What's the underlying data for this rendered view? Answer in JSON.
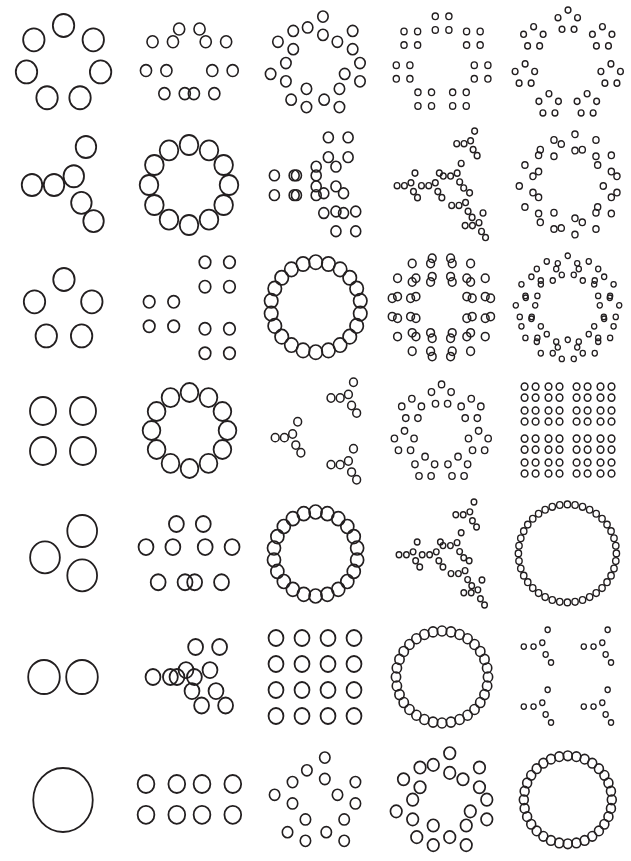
{
  "figure": {
    "name": "hierarchical-dot-pattern-grid",
    "background_color": "#ffffff",
    "stroke_color": "#231f20",
    "width": 631,
    "height": 861,
    "rows": 7,
    "columns": 5
  },
  "shapes": {
    "ring7": {
      "label": "ring-of-7",
      "count": 7,
      "type": "ring",
      "points": [
        [
          0.0,
          -1.0
        ],
        [
          0.782,
          -0.623
        ],
        [
          0.975,
          0.223
        ],
        [
          0.434,
          0.901
        ],
        [
          -0.434,
          0.901
        ],
        [
          -0.975,
          0.223
        ],
        [
          -0.782,
          -0.623
        ]
      ]
    },
    "ring6y": {
      "label": "y-arrow-6",
      "count": 6,
      "type": "custom",
      "points": [
        [
          -1.0,
          0.05
        ],
        [
          -0.42,
          0.05
        ],
        [
          0.1,
          -0.18
        ],
        [
          0.42,
          -0.95
        ],
        [
          0.3,
          0.52
        ],
        [
          0.62,
          1.0
        ]
      ]
    },
    "ring5": {
      "label": "ring-of-5",
      "count": 5,
      "type": "ring",
      "points": [
        [
          -0.05,
          -1.0
        ],
        [
          0.85,
          -0.28
        ],
        [
          0.52,
          0.82
        ],
        [
          -0.62,
          0.82
        ],
        [
          -1.0,
          -0.28
        ]
      ]
    },
    "square4": {
      "label": "square-of-4",
      "count": 4,
      "type": "square",
      "points": [
        [
          -1.0,
          -1.0
        ],
        [
          1.0,
          -1.0
        ],
        [
          -1.0,
          1.0
        ],
        [
          1.0,
          1.0
        ]
      ]
    },
    "tri3": {
      "label": "triangle-of-3",
      "count": 3,
      "type": "triangle",
      "points": [
        [
          0.55,
          -1.0
        ],
        [
          -1.0,
          0.1
        ],
        [
          0.55,
          0.85
        ]
      ]
    },
    "pair2": {
      "label": "pair-of-2",
      "count": 2,
      "type": "pair",
      "points": [
        [
          -1.0,
          0.0
        ],
        [
          1.0,
          0.0
        ]
      ]
    },
    "single1": {
      "label": "single",
      "count": 1,
      "type": "single",
      "points": [
        [
          0.0,
          0.0
        ]
      ]
    },
    "ring12": {
      "label": "ring-of-12",
      "count": 12,
      "type": "ring"
    },
    "ring22": {
      "label": "ring-of-22",
      "count": 22,
      "type": "ring"
    },
    "ring32": {
      "label": "ring-of-32",
      "count": 32,
      "type": "ring"
    },
    "ring40": {
      "label": "ring-of-40",
      "count": 40,
      "type": "ring"
    }
  },
  "cells": [
    {
      "row": 1,
      "col": 1,
      "name": "cell-r1c1",
      "levels": [
        "ring7"
      ],
      "radius": 11.5,
      "scale": 38,
      "stroke": 1.8
    },
    {
      "row": 1,
      "col": 2,
      "name": "cell-r1c2",
      "levels": [
        "ring7",
        "pair2"
      ],
      "radius": 6.0,
      "scale": 34,
      "sub": 0.3,
      "stroke": 1.6
    },
    {
      "row": 1,
      "col": 3,
      "name": "cell-r1c3",
      "levels": [
        "ring7",
        "tri3"
      ],
      "radius": 5.6,
      "scale": 38,
      "sub": 0.26,
      "stroke": 1.6
    },
    {
      "row": 1,
      "col": 4,
      "name": "cell-r1c4",
      "levels": [
        "ring7",
        "square4"
      ],
      "radius": 3.3,
      "scale": 40,
      "sub": 0.17,
      "stroke": 1.4
    },
    {
      "row": 1,
      "col": 5,
      "name": "cell-r1c5",
      "levels": [
        "ring7",
        "ring5"
      ],
      "radius": 3.1,
      "scale": 44,
      "sub": 0.24,
      "stroke": 1.4
    },
    {
      "row": 2,
      "col": 1,
      "name": "cell-r2c1",
      "levels": [
        "ring6y"
      ],
      "radius": 11.0,
      "scale": 38,
      "stroke": 1.8
    },
    {
      "row": 2,
      "col": 2,
      "name": "cell-r2c2",
      "levels": [
        "ring12"
      ],
      "radius": 10.0,
      "scale": 40,
      "stroke": 1.8
    },
    {
      "row": 2,
      "col": 3,
      "name": "cell-r2c3",
      "levels": [
        "ring6y",
        "square4"
      ],
      "radius": 5.4,
      "scale": 38,
      "sub": 0.26,
      "stroke": 1.6
    },
    {
      "row": 2,
      "col": 4,
      "name": "cell-r2c4",
      "levels": [
        "ring6y",
        "ring6y"
      ],
      "radius": 3.1,
      "scale": 42,
      "sub": 0.3,
      "stroke": 1.4
    },
    {
      "row": 2,
      "col": 5,
      "name": "cell-r2c5",
      "levels": [
        "ring12",
        "tri3"
      ],
      "radius": 3.3,
      "scale": 42,
      "sub": 0.21,
      "stroke": 1.4
    },
    {
      "row": 3,
      "col": 1,
      "name": "cell-r3c1",
      "levels": [
        "ring5"
      ],
      "radius": 11.5,
      "scale": 31,
      "stroke": 1.8
    },
    {
      "row": 3,
      "col": 2,
      "name": "cell-r3c2",
      "levels": [
        "tri3",
        "square4"
      ],
      "radius": 6.2,
      "scale": 36,
      "sub": 0.34,
      "stroke": 1.7
    },
    {
      "row": 3,
      "col": 3,
      "name": "cell-r3c3",
      "levels": [
        "ring22"
      ],
      "radius": 7.2,
      "scale": 45,
      "stroke": 1.7
    },
    {
      "row": 3,
      "col": 4,
      "name": "cell-r3c4",
      "levels": [
        "ring12",
        "square4"
      ],
      "radius": 4.2,
      "scale": 40,
      "sub": 0.23,
      "stroke": 1.5
    },
    {
      "row": 3,
      "col": 5,
      "name": "cell-r3c5",
      "levels": [
        "ring12",
        "ring5"
      ],
      "radius": 2.8,
      "scale": 42,
      "sub": 0.25,
      "stroke": 1.3
    },
    {
      "row": 4,
      "col": 1,
      "name": "cell-r4c1",
      "levels": [
        "square4"
      ],
      "radius": 14.0,
      "scale": 20,
      "stroke": 1.8
    },
    {
      "row": 4,
      "col": 2,
      "name": "cell-r4c2",
      "levels": [
        "ring12"
      ],
      "radius": 9.5,
      "scale": 38,
      "stroke": 1.8
    },
    {
      "row": 4,
      "col": 3,
      "name": "cell-r4c3",
      "levels": [
        "tri3",
        "ring6y"
      ],
      "radius": 4.2,
      "scale": 36,
      "sub": 0.44,
      "stroke": 1.5
    },
    {
      "row": 4,
      "col": 4,
      "name": "cell-r4c4",
      "levels": [
        "ring7",
        "ring5"
      ],
      "radius": 3.4,
      "scale": 38,
      "sub": 0.28,
      "stroke": 1.4
    },
    {
      "row": 4,
      "col": 5,
      "name": "cell-r4c5",
      "levels": [
        "square4",
        "square4",
        "square4"
      ],
      "radius": 3.6,
      "scale": 26,
      "sub": 0.46,
      "stroke": 1.5
    },
    {
      "row": 5,
      "col": 1,
      "name": "cell-r5c1",
      "levels": [
        "tri3"
      ],
      "radius": 16.0,
      "scale": 24,
      "stroke": 1.8
    },
    {
      "row": 5,
      "col": 2,
      "name": "cell-r5c2",
      "levels": [
        "ring5",
        "pair2"
      ],
      "radius": 8.0,
      "scale": 32,
      "sub": 0.42,
      "stroke": 1.8
    },
    {
      "row": 5,
      "col": 3,
      "name": "cell-r5c3",
      "levels": [
        "ring22"
      ],
      "radius": 7.0,
      "scale": 42,
      "stroke": 1.7
    },
    {
      "row": 5,
      "col": 4,
      "name": "cell-r5c4",
      "levels": [
        "ring6y",
        "ring6y"
      ],
      "radius": 3.0,
      "scale": 40,
      "sub": 0.32,
      "stroke": 1.4
    },
    {
      "row": 5,
      "col": 5,
      "name": "cell-r5c5",
      "levels": [
        "ring40"
      ],
      "radius": 3.4,
      "scale": 49,
      "stroke": 1.4
    },
    {
      "row": 6,
      "col": 1,
      "name": "cell-r6c1",
      "levels": [
        "pair2"
      ],
      "radius": 17.0,
      "scale": 19,
      "stroke": 1.8
    },
    {
      "row": 6,
      "col": 2,
      "name": "cell-r6c2",
      "levels": [
        "ring6y",
        "pair2"
      ],
      "radius": 8.0,
      "scale": 30,
      "sub": 0.4,
      "stroke": 1.8
    },
    {
      "row": 6,
      "col": 3,
      "name": "cell-r6c3",
      "levels": [
        "square4",
        "square4"
      ],
      "radius": 8.0,
      "scale": 26,
      "sub": 0.5,
      "stroke": 1.8
    },
    {
      "row": 6,
      "col": 4,
      "name": "cell-r6c4",
      "levels": [
        "ring32"
      ],
      "radius": 5.0,
      "scale": 46,
      "stroke": 1.6
    },
    {
      "row": 6,
      "col": 5,
      "name": "cell-r6c5",
      "levels": [
        "square4",
        "ring6y"
      ],
      "radius": 2.8,
      "scale": 30,
      "sub": 0.56,
      "stroke": 1.3
    },
    {
      "row": 7,
      "col": 1,
      "name": "cell-r7c1",
      "levels": [
        "single1"
      ],
      "radius": 32.0,
      "scale": 1,
      "stroke": 1.8
    },
    {
      "row": 7,
      "col": 2,
      "name": "cell-r7c2",
      "levels": [
        "pair2",
        "square4"
      ],
      "radius": 9.0,
      "scale": 28,
      "sub": 0.55,
      "stroke": 1.8
    },
    {
      "row": 7,
      "col": 3,
      "name": "cell-r7c3",
      "levels": [
        "ring5",
        "tri3"
      ],
      "radius": 5.6,
      "scale": 34,
      "sub": 0.34,
      "stroke": 1.6
    },
    {
      "row": 7,
      "col": 4,
      "name": "cell-r7c4",
      "levels": [
        "ring7",
        "tri3"
      ],
      "radius": 6.2,
      "scale": 38,
      "sub": 0.28,
      "stroke": 1.7
    },
    {
      "row": 7,
      "col": 5,
      "name": "cell-r7c5",
      "levels": [
        "ring32"
      ],
      "radius": 4.8,
      "scale": 44,
      "stroke": 1.6
    }
  ]
}
